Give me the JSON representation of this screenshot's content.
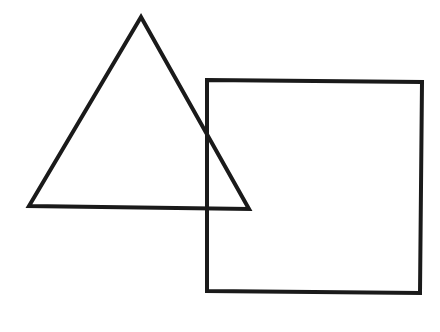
{
  "diagram": {
    "background": "#ffffff",
    "stroke_color": "#1a1a1a",
    "stroke_width": 4,
    "shapes": [
      {
        "type": "triangle",
        "points": [
          [
            141,
            17
          ],
          [
            29,
            206
          ],
          [
            249,
            209
          ]
        ]
      },
      {
        "type": "square",
        "points": [
          [
            207,
            80
          ],
          [
            422,
            82
          ],
          [
            420,
            293
          ],
          [
            207,
            291
          ]
        ]
      }
    ]
  }
}
